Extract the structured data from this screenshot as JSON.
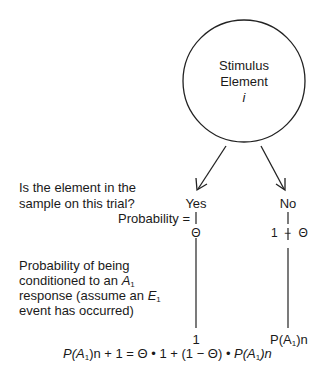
{
  "node": {
    "line1": "Stimulus",
    "line2": "Element",
    "symbol": "i"
  },
  "question": {
    "line1": "Is the element in the",
    "line2": "sample on this trial?"
  },
  "branches": {
    "yes": {
      "label": "Yes",
      "probability": "Θ",
      "outcome": "1"
    },
    "no": {
      "label": "No",
      "probability_a": "1",
      "probability_op": "−",
      "probability_b": "Θ",
      "outcome_prefix": "P(A",
      "outcome_sub": "1",
      "outcome_suffix": ")n"
    }
  },
  "probability_label": "Probability =",
  "conditioning": {
    "line1": "Probability of being",
    "line2_prefix": "conditioned to an ",
    "line2_var": "A",
    "line2_sub": "1",
    "line3_prefix": "response (assume an ",
    "line3_var": "E",
    "line3_sub": "1",
    "line4": "event has occurred)"
  },
  "equation": {
    "lhs_p": "P(",
    "lhs_a": "A",
    "lhs_sub": "1",
    "lhs_rest": ")n + 1 = Θ • 1 + (1 − Θ) • ",
    "rhs_p": "P(",
    "rhs_a": "A",
    "rhs_sub": "1",
    "rhs_rest": ")n"
  }
}
